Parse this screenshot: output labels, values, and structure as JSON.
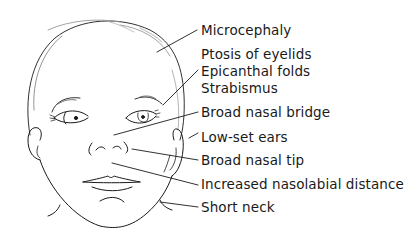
{
  "diagram": {
    "line_color": "#1a1a1a",
    "background": "#ffffff",
    "labels": [
      {
        "id": "microcephaly",
        "text": "Microcephaly",
        "top": 22
      },
      {
        "id": "ptosis",
        "text": "Ptosis of eyelids",
        "top": 46
      },
      {
        "id": "epicanthal",
        "text": "Epicanthal folds",
        "top": 63
      },
      {
        "id": "strabismus",
        "text": "Strabismus",
        "top": 80
      },
      {
        "id": "nasal-bridge",
        "text": "Broad nasal bridge",
        "top": 104
      },
      {
        "id": "low-set-ears",
        "text": "Low-set ears",
        "top": 129
      },
      {
        "id": "nasal-tip",
        "text": "Broad nasal tip",
        "top": 152
      },
      {
        "id": "nasolabial",
        "text": "Increased nasolabial distance",
        "top": 176
      },
      {
        "id": "short-neck",
        "text": "Short neck",
        "top": 199
      }
    ]
  }
}
